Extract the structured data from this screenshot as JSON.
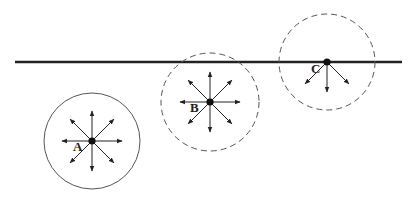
{
  "diagram": {
    "surface_line": {
      "x1": 15,
      "x2": 402,
      "y": 62,
      "color": "#222222"
    },
    "points": [
      {
        "label": "A",
        "cx": 92,
        "cy": 141,
        "r": 48,
        "circle_style": "solid",
        "arrows": [
          "N",
          "NE",
          "E",
          "SE",
          "S",
          "SW",
          "W",
          "NW"
        ],
        "label_x": 73,
        "label_y": 142
      },
      {
        "label": "B",
        "cx": 210,
        "cy": 102,
        "r": 49,
        "circle_style": "dashed",
        "arrows": [
          "N",
          "NE",
          "E",
          "SE",
          "S",
          "SW",
          "W",
          "NW"
        ],
        "label_x": 190,
        "label_y": 103
      },
      {
        "label": "C",
        "cx": 327,
        "cy": 62,
        "r": 48,
        "circle_style": "dashed",
        "arrows": [
          "SE",
          "S",
          "SW"
        ],
        "label_x": 311,
        "label_y": 64
      }
    ],
    "colors": {
      "stroke": "#222222",
      "circle": "#555555"
    }
  }
}
